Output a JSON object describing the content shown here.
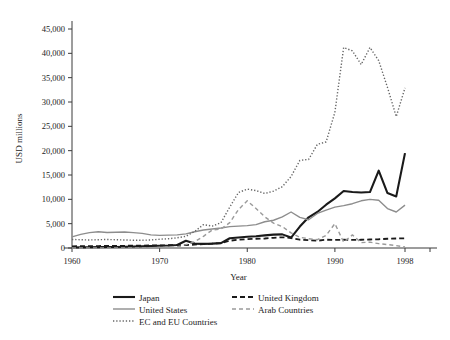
{
  "chart_data": {
    "type": "line",
    "title": "",
    "xlabel": "Year",
    "ylabel": "USD millions",
    "xlim": [
      1960,
      1998
    ],
    "ylim": [
      0,
      45000
    ],
    "xticks": [
      1960,
      1970,
      1980,
      1990,
      1998
    ],
    "yticks": [
      0,
      5000,
      10000,
      15000,
      20000,
      25000,
      30000,
      35000,
      40000,
      45000
    ],
    "ytick_labels": [
      "0",
      "5,000",
      "10,000",
      "15,000",
      "20,000",
      "25,000",
      "30,000",
      "35,000",
      "40,000",
      "45,000"
    ],
    "xtick_labels": [
      "1960",
      "1970",
      "1980",
      "1990",
      "1998"
    ],
    "grid": false,
    "legend_position": "bottom",
    "x": [
      1960,
      1961,
      1962,
      1963,
      1964,
      1965,
      1966,
      1967,
      1968,
      1969,
      1970,
      1971,
      1972,
      1973,
      1974,
      1975,
      1976,
      1977,
      1978,
      1979,
      1980,
      1981,
      1982,
      1983,
      1984,
      1985,
      1986,
      1987,
      1988,
      1989,
      1990,
      1991,
      1992,
      1993,
      1994,
      1995,
      1996,
      1997,
      1998
    ],
    "series": [
      {
        "name": "Japan",
        "style": "solid",
        "color": "#1a1a1a",
        "width": 2.1,
        "values": [
          100,
          120,
          150,
          180,
          200,
          220,
          260,
          300,
          350,
          420,
          460,
          500,
          620,
          1500,
          900,
          850,
          900,
          1000,
          2000,
          2150,
          2300,
          2400,
          2600,
          2750,
          2800,
          2150,
          4400,
          6300,
          7400,
          8900,
          10200,
          11700,
          11500,
          11400,
          11500,
          15900,
          11300,
          10600,
          19500
        ]
      },
      {
        "name": "United States",
        "style": "solid",
        "color": "#8d8d8d",
        "width": 1.4,
        "values": [
          2300,
          2800,
          3150,
          3350,
          3200,
          3250,
          3300,
          3150,
          3000,
          2700,
          2600,
          2650,
          2700,
          2900,
          3350,
          3700,
          3900,
          4100,
          4400,
          4500,
          4600,
          4800,
          5400,
          5700,
          6400,
          7400,
          6300,
          5800,
          7100,
          7800,
          8400,
          8700,
          9100,
          9700,
          10000,
          9800,
          8100,
          7400,
          8800
        ]
      },
      {
        "name": "United Kingdom",
        "style": "dashed",
        "color": "#1a1a1a",
        "width": 1.8,
        "values": [
          350,
          360,
          380,
          400,
          420,
          430,
          450,
          470,
          500,
          520,
          540,
          560,
          580,
          600,
          700,
          800,
          900,
          1000,
          1500,
          1700,
          1800,
          1900,
          1950,
          2100,
          2200,
          2050,
          1700,
          1600,
          1500,
          1700,
          1650,
          1700,
          1650,
          1700,
          1750,
          1800,
          1900,
          1950,
          2000
        ]
      },
      {
        "name": "Arab Countries",
        "style": "dashed",
        "color": "#9a9a9a",
        "width": 1.4,
        "values": [
          0,
          0,
          0,
          0,
          0,
          0,
          0,
          0,
          0,
          0,
          100,
          150,
          200,
          700,
          1300,
          2400,
          3700,
          3900,
          5200,
          7900,
          9700,
          8100,
          6400,
          5100,
          4400,
          3100,
          2200,
          1900,
          1700,
          2600,
          5000,
          1200,
          2700,
          1100,
          1200,
          900,
          700,
          500,
          200
        ]
      },
      {
        "name": "EC and EU Countries",
        "style": "dotted",
        "color": "#666666",
        "width": 1.4,
        "values": [
          1750,
          1700,
          1650,
          1700,
          1750,
          1700,
          1650,
          1600,
          1600,
          1650,
          1800,
          1900,
          2100,
          2400,
          3400,
          4800,
          4500,
          5200,
          8400,
          11400,
          12100,
          11800,
          11200,
          11700,
          12600,
          14700,
          18000,
          18200,
          21300,
          21800,
          27900,
          41200,
          40500,
          37700,
          41200,
          38500,
          33000,
          27000,
          32900
        ]
      }
    ]
  },
  "legend": {
    "items": [
      {
        "label": "Japan",
        "series": "Japan"
      },
      {
        "label": "United Kingdom",
        "series": "United Kingdom"
      },
      {
        "label": "United States",
        "series": "United States"
      },
      {
        "label": "Arab Countries",
        "series": "Arab Countries"
      },
      {
        "label": "EC and EU Countries",
        "series": "EC and EU Countries"
      }
    ]
  }
}
